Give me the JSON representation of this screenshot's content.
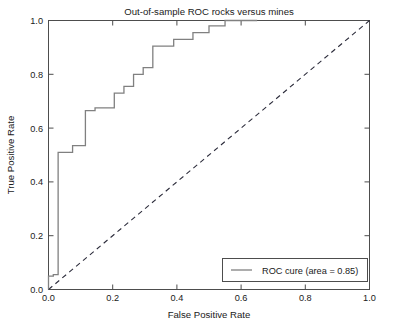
{
  "chart_data": {
    "type": "line",
    "title": "Out-of-sample ROC rocks versus mines",
    "xlabel": "False Positive Rate",
    "ylabel": "True Positive Rate",
    "xlim": [
      0.0,
      1.0
    ],
    "ylim": [
      0.0,
      1.0
    ],
    "grid": false,
    "legend_position": "lower right",
    "xticks": [
      "0.0",
      "0.2",
      "0.4",
      "0.6",
      "0.8",
      "1.0"
    ],
    "xtick_values": [
      0.0,
      0.2,
      0.4,
      0.6,
      0.8,
      1.0
    ],
    "yticks": [
      "0.0",
      "0.2",
      "0.4",
      "0.6",
      "0.8",
      "1.0"
    ],
    "ytick_values": [
      0.0,
      0.2,
      0.4,
      0.6,
      0.8,
      1.0
    ],
    "auc": 0.85,
    "series": [
      {
        "name": "ROC cure (area = 0.85)",
        "style": "step",
        "color": "#808080",
        "x": [
          0.0,
          0.0,
          0.015,
          0.015,
          0.03,
          0.03,
          0.075,
          0.075,
          0.115,
          0.115,
          0.145,
          0.145,
          0.205,
          0.205,
          0.235,
          0.235,
          0.265,
          0.265,
          0.295,
          0.295,
          0.325,
          0.325,
          0.39,
          0.39,
          0.45,
          0.45,
          0.5,
          0.5,
          0.55,
          0.55,
          0.65
        ],
        "y": [
          0.0,
          0.05,
          0.05,
          0.055,
          0.055,
          0.51,
          0.51,
          0.535,
          0.535,
          0.665,
          0.665,
          0.675,
          0.675,
          0.73,
          0.73,
          0.755,
          0.755,
          0.8,
          0.8,
          0.825,
          0.825,
          0.905,
          0.905,
          0.93,
          0.93,
          0.955,
          0.955,
          0.98,
          0.98,
          1.0,
          1.0
        ]
      },
      {
        "name": "chance-diagonal",
        "style": "dashed",
        "color": "#2b2b3a",
        "x": [
          0.0,
          1.0
        ],
        "y": [
          0.0,
          1.0
        ]
      }
    ]
  },
  "legend": {
    "entries": [
      {
        "label": "ROC cure (area = 0.85)"
      }
    ]
  }
}
